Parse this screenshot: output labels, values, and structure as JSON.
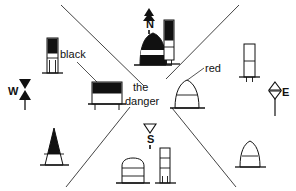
{
  "diagram": {
    "center_text_line1": "the",
    "center_text_line2": "danger",
    "annotations": [
      {
        "id": "black",
        "label": "black",
        "x": 60,
        "y": 48
      },
      {
        "id": "red",
        "label": "red",
        "x": 205,
        "y": 62
      }
    ],
    "cardinals": [
      {
        "id": "north",
        "label": "N",
        "topmark": "two-cones-point-up-solid",
        "x": 146,
        "y": 18
      },
      {
        "id": "south",
        "label": "S",
        "topmark": "two-cones-point-down-hollow",
        "x": 147,
        "y": 133
      },
      {
        "id": "east",
        "label": "E",
        "topmark": "two-cones-base-to-base-hollow",
        "x": 282,
        "y": 86
      },
      {
        "id": "west",
        "label": "W",
        "topmark": "two-cones-point-to-point-solid",
        "x": 8,
        "y": 85
      }
    ],
    "buoys": [
      {
        "id": "nw-pillar",
        "shape": "pillar",
        "colors": "black-over-white",
        "quadrant": "NW"
      },
      {
        "id": "nw-can",
        "shape": "can",
        "colors": "black-over-white",
        "quadrant": "NW"
      },
      {
        "id": "n-conical",
        "shape": "conical",
        "colors": "black-white-black-bands",
        "quadrant": "N"
      },
      {
        "id": "ne-pillar",
        "shape": "pillar",
        "colors": "black-over-white",
        "quadrant": "NE"
      },
      {
        "id": "e-pillar",
        "shape": "pillar",
        "colors": "white-banded",
        "quadrant": "E"
      },
      {
        "id": "center-conical",
        "shape": "conical",
        "colors": "white-banded",
        "quadrant": "E"
      },
      {
        "id": "sw-conical",
        "shape": "conical",
        "colors": "black-over-white",
        "quadrant": "SW"
      },
      {
        "id": "s-can",
        "shape": "can",
        "colors": "white-banded",
        "quadrant": "S"
      },
      {
        "id": "s-pillar",
        "shape": "pillar",
        "colors": "white-banded",
        "quadrant": "S"
      },
      {
        "id": "se-conical",
        "shape": "conical",
        "colors": "white-banded",
        "quadrant": "SE"
      }
    ],
    "sector_lines": [
      {
        "id": "nw-se-upper",
        "x1": 60,
        "y1": 5,
        "x2": 143,
        "y2": 86
      },
      {
        "id": "ne-sw-upper",
        "x1": 238,
        "y1": 5,
        "x2": 166,
        "y2": 78
      },
      {
        "id": "nw-se-lower",
        "x1": 130,
        "y1": 108,
        "x2": 66,
        "y2": 186
      },
      {
        "id": "ne-sw-lower",
        "x1": 172,
        "y1": 108,
        "x2": 235,
        "y2": 186
      }
    ],
    "colors": {
      "ink": "#111111",
      "black_fill": "#111111",
      "white_fill": "#ffffff",
      "line": "#444444",
      "background": "#ffffff"
    }
  }
}
